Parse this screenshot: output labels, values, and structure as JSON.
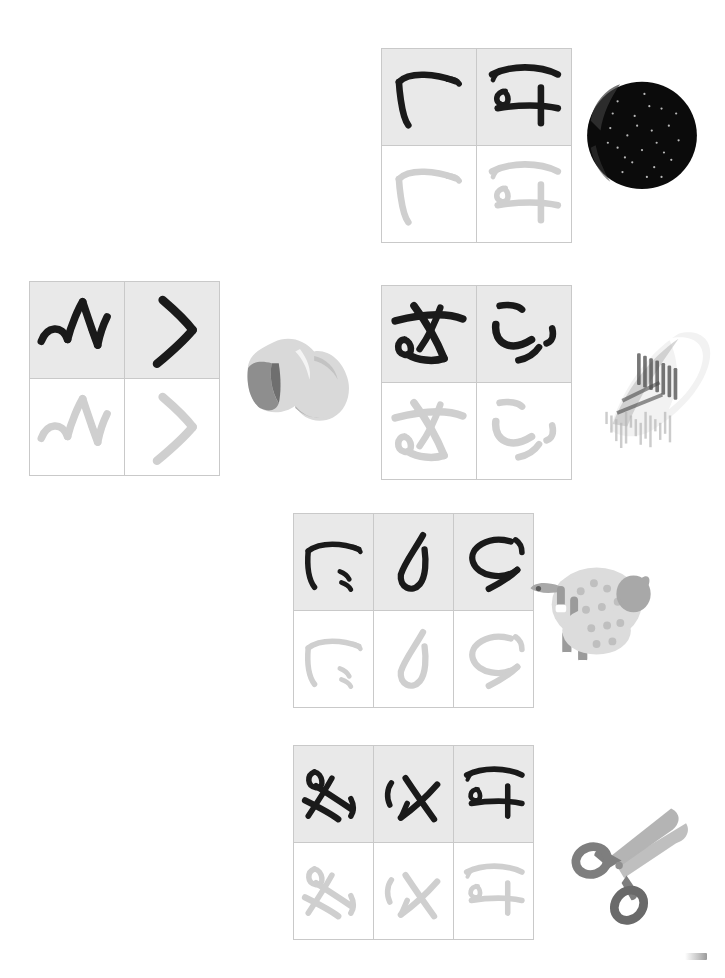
{
  "page": {
    "background_color": "#ffffff",
    "width": 725,
    "height": 978,
    "model_cell_bg": "#e9e9e9",
    "trace_cell_bg": "#ffffff",
    "cell_border_color": "#c9c9c9",
    "model_stroke_color": "#1a1a1a",
    "trace_stroke_color": "#cfcfcf"
  },
  "groups": [
    {
      "id": "group-1",
      "label": "group-1",
      "x": 381,
      "y": 48,
      "cell_width": 94,
      "cell_height": 96,
      "columns": 2,
      "model_row_label": "model-strokes",
      "trace_row_label": "trace-strokes",
      "cells": [
        {
          "name": "stroke-hook-left",
          "glyph": "hook-left"
        },
        {
          "name": "stroke-tai-bar-loop",
          "glyph": "tai-bar-loop"
        }
      ],
      "photo": {
        "name": "dark-round-fruit-photo",
        "kind": "round-dark-object",
        "x": 578,
        "y": 72,
        "width": 128,
        "height": 122,
        "colors": {
          "body": "#0b0b0b",
          "highlight": "#3a3a3a",
          "speck": "#d8d8d8"
        }
      }
    },
    {
      "id": "group-2",
      "label": "group-2",
      "x": 29,
      "y": 281,
      "cell_width": 94,
      "cell_height": 96,
      "columns": 2,
      "model_row_label": "model-strokes",
      "trace_row_label": "trace-strokes",
      "cells": [
        {
          "name": "stroke-wave-zigzag",
          "glyph": "wave-zigzag"
        },
        {
          "name": "stroke-angle-chevron",
          "glyph": "angle-chevron"
        }
      ],
      "photo": {
        "name": "crumpled-cloth-photo",
        "kind": "crumpled-cloth",
        "x": 236,
        "y": 316,
        "width": 128,
        "height": 118,
        "colors": {
          "body": "#d9d9d9",
          "shade": "#8e8e8e",
          "dark": "#6f6f6f"
        }
      }
    },
    {
      "id": "group-3",
      "label": "group-3",
      "x": 381,
      "y": 285,
      "cell_width": 94,
      "cell_height": 96,
      "columns": 2,
      "model_row_label": "model-strokes",
      "trace_row_label": "trace-strokes",
      "cells": [
        {
          "name": "stroke-crossed-loop",
          "glyph": "crossed-loop"
        },
        {
          "name": "stroke-three-commas",
          "glyph": "three-commas"
        }
      ],
      "photo": {
        "name": "rolled-newspaper-photo",
        "kind": "rolled-newspaper",
        "x": 598,
        "y": 322,
        "width": 122,
        "height": 126,
        "colors": {
          "paper": "#f2f2f2",
          "ink": "#4a4a4a",
          "shade": "#b6b6b6"
        }
      }
    },
    {
      "id": "group-4",
      "label": "group-4",
      "x": 293,
      "y": 513,
      "cell_width": 79,
      "cell_height": 96,
      "columns": 3,
      "model_row_label": "model-strokes",
      "trace_row_label": "trace-strokes",
      "cells": [
        {
          "name": "stroke-hook-with-ticks",
          "glyph": "hook-with-ticks"
        },
        {
          "name": "stroke-j-curve",
          "glyph": "j-curve"
        },
        {
          "name": "stroke-loop-tail",
          "glyph": "loop-tail"
        }
      ],
      "photo": {
        "name": "sheep-photo",
        "kind": "sheep",
        "x": 518,
        "y": 549,
        "width": 136,
        "height": 132,
        "colors": {
          "wool": "#dcdcdc",
          "shade": "#a8a8a8",
          "leg": "#9b9b9b",
          "hoof": "#5c5c5c"
        }
      }
    },
    {
      "id": "group-5",
      "label": "group-5",
      "x": 293,
      "y": 745,
      "cell_width": 79,
      "cell_height": 96,
      "columns": 3,
      "model_row_label": "model-strokes",
      "trace_row_label": "trace-strokes",
      "cells": [
        {
          "name": "stroke-star-knot",
          "glyph": "star-knot"
        },
        {
          "name": "stroke-cross-tick",
          "glyph": "cross-tick"
        },
        {
          "name": "stroke-tai-bar-loop-2",
          "glyph": "tai-bar-loop"
        }
      ],
      "photo": {
        "name": "scissors-photo",
        "kind": "scissors",
        "x": 560,
        "y": 806,
        "width": 138,
        "height": 124,
        "colors": {
          "blade": "#b4b4b4",
          "handle": "#7e7e7e",
          "dark": "#6a6a6a"
        }
      }
    }
  ],
  "corner_mark": {
    "name": "page-corner-smudge",
    "visible": true
  }
}
